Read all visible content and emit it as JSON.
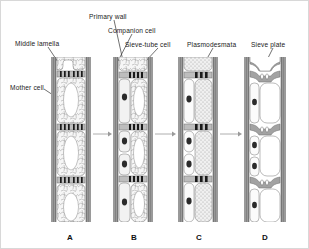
{
  "figure": {
    "background": "#ffffff",
    "width": 309,
    "height": 249
  },
  "labels": [
    {
      "id": "middle-lamella",
      "text": "Middle lamella",
      "x": 14,
      "y": 40,
      "leader": {
        "x1": 47,
        "y1": 46,
        "x2": 57,
        "y2": 61
      }
    },
    {
      "id": "mother-cell",
      "text": "Mother cell",
      "x": 9,
      "y": 84,
      "leader": {
        "x1": 43,
        "y1": 88,
        "x2": 55,
        "y2": 96
      }
    },
    {
      "id": "primary-wall",
      "text": "Primary wall",
      "x": 88,
      "y": 13,
      "leader": {
        "x1": 113,
        "y1": 19,
        "x2": 122,
        "y2": 60
      }
    },
    {
      "id": "companion-cell",
      "text": "Companion cell",
      "x": 107,
      "y": 27,
      "leader": {
        "x1": 131,
        "y1": 33,
        "x2": 117,
        "y2": 60
      }
    },
    {
      "id": "sieve-tube-cell",
      "text": "Sieve-tube cell",
      "x": 124,
      "y": 41,
      "leader": {
        "x1": 157,
        "y1": 47,
        "x2": 143,
        "y2": 62
      }
    },
    {
      "id": "plasmodesmata",
      "text": "Plasmodesmata",
      "x": 186,
      "y": 41,
      "leader": {
        "x1": 212,
        "y1": 47,
        "x2": 203,
        "y2": 63
      }
    },
    {
      "id": "sieve-plate",
      "text": "Sieve plate",
      "x": 257,
      "y": 41,
      "leader": {
        "x1": 272,
        "y1": 47,
        "x2": 262,
        "y2": 67
      }
    }
  ],
  "panels": [
    {
      "id": "A",
      "letter": "A",
      "caption": "Mother cell with dense cytoplasm and large vacuole",
      "x": 50,
      "width": 40,
      "wall_color": "#9a9a9a",
      "cytoplasm": "reticulate",
      "cells": 4,
      "has_companion": false,
      "has_sieve_plate": false
    },
    {
      "id": "B",
      "letter": "B",
      "caption": "Division forms companion cell and sieve-tube cell",
      "x": 112,
      "width": 40,
      "wall_color": "#9a9a9a",
      "cytoplasm": "reticulate",
      "cells": 4,
      "has_companion": true,
      "has_sieve_plate": false
    },
    {
      "id": "C",
      "letter": "C",
      "caption": "Sieve-tube cell cytoplasm becomes stippled, plasmodesmata widen",
      "x": 177,
      "width": 40,
      "wall_color": "#9a9a9a",
      "cytoplasm": "stippled",
      "cells": 4,
      "has_companion": true,
      "has_sieve_plate": false
    },
    {
      "id": "D",
      "letter": "D",
      "caption": "Mature sieve tube with sieve plates and open lumen",
      "x": 243,
      "width": 42,
      "wall_color": "#9a9a9a",
      "cytoplasm": "empty",
      "cells": 4,
      "has_companion": true,
      "has_sieve_plate": true
    }
  ],
  "panel_letters": [
    {
      "text": "A",
      "x": 66,
      "y": 232
    },
    {
      "text": "B",
      "x": 130,
      "y": 232
    },
    {
      "text": "C",
      "x": 195,
      "y": 232
    },
    {
      "text": "D",
      "x": 261,
      "y": 232
    }
  ],
  "arrows": [
    {
      "id": "arrow-a-b",
      "x1": 92,
      "y1": 133,
      "x2": 110,
      "y2": 133
    },
    {
      "id": "arrow-b-c",
      "x1": 154,
      "y1": 133,
      "x2": 175,
      "y2": 133
    },
    {
      "id": "arrow-c-d",
      "x1": 219,
      "y1": 133,
      "x2": 241,
      "y2": 133
    }
  ],
  "colors": {
    "wall": "#9a9a9a",
    "wall_dark": "#6e6e6e",
    "plasmodesmata": "#1a1a1a",
    "nucleus": "#2b2b2b",
    "cytoplasm_light": "#f4f4f4",
    "stipple": "#cfcfcf",
    "arrow": "#9a9a9a",
    "text": "#1a1a1a"
  }
}
